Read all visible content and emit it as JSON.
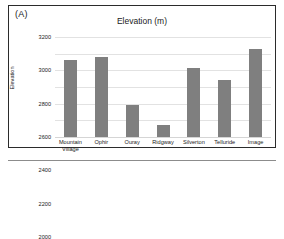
{
  "panel": {
    "label": "(A)"
  },
  "chart_data": {
    "type": "bar",
    "title": "Elevation (m)",
    "xlabel": "",
    "ylabel": "Elevation",
    "categories": [
      "Mountain\nVillage",
      "Ophir",
      "Ouray",
      "Ridgway",
      "Silverton",
      "Telluride",
      "Image"
    ],
    "values": [
      2920,
      2960,
      2390,
      2150,
      2830,
      2690,
      3060
    ],
    "ylim": [
      2000,
      3200
    ],
    "yticks": [
      2000,
      2200,
      2400,
      2600,
      2800,
      3000,
      3200
    ],
    "ytick_labels": [
      "2000",
      "2200",
      "2400",
      "2600",
      "2800",
      "3000",
      "3200"
    ],
    "grid": true,
    "legend": false,
    "bar_color": "#7f7f7f"
  }
}
